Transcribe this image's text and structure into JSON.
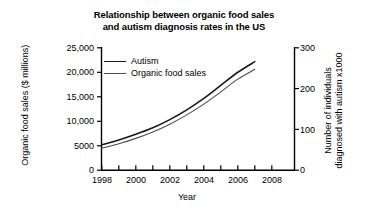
{
  "chart_data": {
    "type": "line",
    "title": "Relationship between organic food sales and autism diagnosis rates in the US",
    "title_lines": [
      "Relationship between organic food sales",
      "and autism diagnosis rates in the US"
    ],
    "xlabel": "Year",
    "ylabel": "Organic food sales ($ millions)",
    "y2label": "Number of individuals diagnosed with autism x1000",
    "y2label_lines": [
      "Number of individuals",
      "diagnosed with autism x1000"
    ],
    "grid": false,
    "legend_position": "upper left",
    "xlim": [
      1997,
      2009
    ],
    "ylim": [
      0,
      25000
    ],
    "y2lim": [
      0,
      300
    ],
    "xticks": [
      1998,
      1999,
      2000,
      2001,
      2002,
      2003,
      2004,
      2005,
      2006,
      2007,
      2008
    ],
    "xtick_labels": [
      "1998",
      "",
      "2000",
      "",
      "2002",
      "",
      "2004",
      "",
      "2006",
      "",
      "2008"
    ],
    "yticks": [
      0,
      5000,
      10000,
      15000,
      20000,
      25000
    ],
    "ytick_labels": [
      "0",
      "5000",
      "10,000",
      "15,000",
      "20,000",
      "25,000"
    ],
    "y2ticks": [
      0,
      100,
      200,
      300
    ],
    "y2tick_labels": [
      "0",
      "100",
      "200",
      "300"
    ],
    "x": [
      1998,
      1999,
      2000,
      2001,
      2002,
      2003,
      2004,
      2005,
      2006,
      2007
    ],
    "series": [
      {
        "name": "Autism",
        "axis": "right",
        "units": "individuals diagnosed with autism x1000",
        "color": "#1a1a1a",
        "line_width": 1.6,
        "values": [
          62,
          74,
          88,
          104,
          124,
          148,
          176,
          208,
          240,
          266
        ],
        "values_left_axis_equivalent": [
          5200,
          6200,
          7350,
          8700,
          10350,
          12350,
          14650,
          17350,
          20000,
          22150
        ]
      },
      {
        "name": "Organic food sales",
        "axis": "left",
        "units": "$ millions",
        "color": "#4d4d4d",
        "line_width": 1.1,
        "values": [
          4500,
          5400,
          6500,
          7800,
          9400,
          11300,
          13500,
          16000,
          18600,
          20600
        ]
      }
    ]
  },
  "legend": {
    "items": [
      {
        "label": "Autism"
      },
      {
        "label": "Organic food sales"
      }
    ]
  },
  "colors": {
    "background": "#ffffff",
    "axis": "#000000",
    "autism_line": "#1a1a1a",
    "organic_line": "#4d4d4d"
  }
}
